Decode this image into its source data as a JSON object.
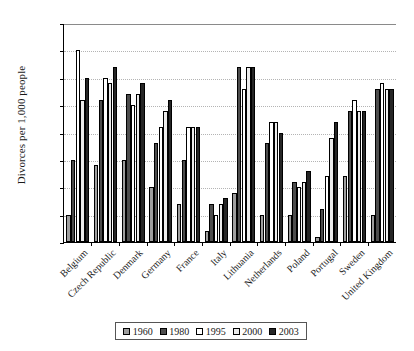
{
  "chart_data": {
    "type": "bar",
    "title": "",
    "xlabel": "",
    "ylabel": "Divorces per 1,000 people",
    "ylim": [
      0,
      4.0
    ],
    "ytick_labels": [
      "4.0",
      "3.5",
      "3.0",
      "2.5",
      "2.0",
      "1.5",
      "1.0",
      "0.5",
      "0"
    ],
    "ytick_values": [
      4.0,
      3.5,
      3.0,
      2.5,
      2.0,
      1.5,
      1.0,
      0.5,
      0
    ],
    "grid": true,
    "legend_position": "bottom",
    "categories": [
      "Belgium",
      "Czech Republic",
      "Denmark",
      "Germany",
      "France",
      "Italy",
      "Lithuania",
      "Netherlands",
      "Poland",
      "Portugal",
      "Sweden",
      "United Kingdom"
    ],
    "series": [
      {
        "name": "1960",
        "color": "#9e9e9e",
        "values": [
          0.5,
          1.4,
          1.5,
          1.0,
          0.7,
          0.2,
          0.9,
          0.5,
          0.5,
          0.1,
          1.2,
          0.5
        ]
      },
      {
        "name": "1980",
        "color": "#4d4d4d",
        "values": [
          1.5,
          2.6,
          2.7,
          1.8,
          1.5,
          0.7,
          3.2,
          1.8,
          1.1,
          0.6,
          2.4,
          2.8
        ]
      },
      {
        "name": "1995",
        "color": "#ffffff",
        "values": [
          3.5,
          3.0,
          2.5,
          2.1,
          2.1,
          0.5,
          2.8,
          2.2,
          1.0,
          1.2,
          2.6,
          2.9
        ]
      },
      {
        "name": "2000",
        "color": "#ececec",
        "values": [
          2.6,
          2.9,
          2.7,
          2.4,
          2.1,
          0.7,
          3.2,
          2.2,
          1.1,
          1.9,
          2.4,
          2.8
        ]
      },
      {
        "name": "2003",
        "color": "#262626",
        "values": [
          3.0,
          3.2,
          2.9,
          2.6,
          2.1,
          0.8,
          3.2,
          2.0,
          1.3,
          2.2,
          2.4,
          2.8
        ]
      }
    ]
  }
}
